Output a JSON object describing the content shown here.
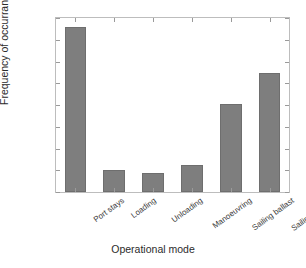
{
  "chart_data": {
    "type": "bar",
    "title": "",
    "xlabel": "Operational mode",
    "ylabel": "Frequency of occurrance",
    "categories": [
      "Port stays",
      "Loading",
      "Unloading",
      "Manoeuvring",
      "Sailing ballast",
      "Sailing loaded"
    ],
    "values": [
      0.38,
      0.05,
      0.043,
      0.061,
      0.202,
      0.273
    ],
    "ylim": [
      0,
      0.4
    ],
    "yticks": [
      0,
      0.05,
      0.1,
      0.15,
      0.2,
      0.25,
      0.3,
      0.35,
      0.4
    ],
    "ytick_labels": [
      "0",
      "0.05",
      "0.1",
      "0.15",
      "0.2",
      "0.25",
      "0.3",
      "0.35",
      "0.4"
    ],
    "grid": false,
    "legend": null,
    "bar_color": "#7e7e7e",
    "bar_edge_color": "#6e6e6e",
    "axis_color": "#bdbdbd",
    "background": "#ffffff"
  }
}
